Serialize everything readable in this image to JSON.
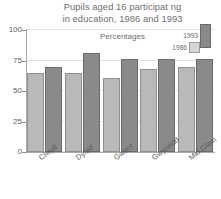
{
  "chart_data": {
    "type": "bar",
    "title_line1": "Pupils aged 16 participat ng",
    "title_line2": "in education, 1986 and 1993",
    "subtitle": "Percentages",
    "xlabel": "",
    "ylabel": "",
    "ylim": [
      0,
      100
    ],
    "yticks": [
      0,
      25,
      50,
      75,
      100
    ],
    "ytick_labels": [
      "0",
      "25",
      "50",
      "75",
      "100"
    ],
    "grid": true,
    "legend_position": "top-right",
    "categories": [
      "Clwyd",
      "Dyfed",
      "Gwent",
      "Gwynedd",
      "Mid Glam"
    ],
    "series": [
      {
        "name": "1986",
        "color": "#b9b9b9",
        "values": [
          65,
          65,
          61,
          68,
          70
        ]
      },
      {
        "name": "1993",
        "color": "#8a8a8a",
        "values": [
          70,
          81,
          76,
          76,
          76
        ]
      }
    ]
  },
  "legend": {
    "items": [
      {
        "label": "1993"
      },
      {
        "label": "1986"
      }
    ]
  },
  "colors": {
    "series_1986": "#b9b9b9",
    "series_1993": "#8a8a8a",
    "axis": "#a9a9a9",
    "grid": "#e3e3e3",
    "text": "#6d6d6d",
    "background": "#ffffff"
  }
}
